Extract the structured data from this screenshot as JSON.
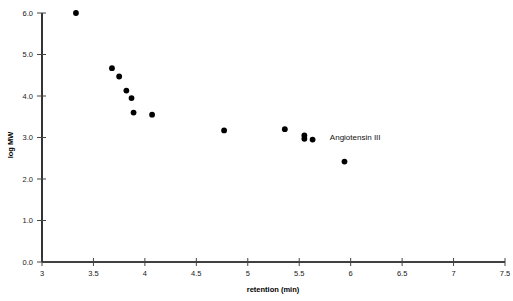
{
  "chart_data": {
    "type": "scatter",
    "title": "",
    "xlabel": "retention (min)",
    "ylabel": "log MW",
    "xlim": [
      3,
      7.5
    ],
    "ylim": [
      0.0,
      6.0
    ],
    "xticks": [
      "3",
      "3.5",
      "4",
      "4.5",
      "5",
      "5.5",
      "6",
      "6.5",
      "7",
      "7.5"
    ],
    "xtick_values": [
      3,
      3.5,
      4,
      4.5,
      5,
      5.5,
      6,
      6.5,
      7,
      7.5
    ],
    "yticks": [
      "0.0",
      "1.0",
      "2.0",
      "3.0",
      "4.0",
      "5.0",
      "6.0"
    ],
    "ytick_values": [
      0.0,
      1.0,
      2.0,
      3.0,
      4.0,
      5.0,
      6.0
    ],
    "grid": false,
    "legend": null,
    "marker": "filled-circle",
    "marker_color": "#000000",
    "x": [
      3.33,
      3.68,
      3.75,
      3.82,
      3.87,
      3.89,
      4.07,
      4.77,
      5.36,
      5.55,
      5.55,
      5.63,
      5.94
    ],
    "y": [
      6.0,
      4.67,
      4.47,
      4.13,
      3.95,
      3.6,
      3.55,
      3.17,
      3.2,
      3.05,
      2.97,
      2.95,
      2.42
    ],
    "points": [
      {
        "x": 3.33,
        "y": 6.0
      },
      {
        "x": 3.68,
        "y": 4.67
      },
      {
        "x": 3.75,
        "y": 4.47
      },
      {
        "x": 3.82,
        "y": 4.13
      },
      {
        "x": 3.87,
        "y": 3.95
      },
      {
        "x": 3.89,
        "y": 3.6
      },
      {
        "x": 4.07,
        "y": 3.55
      },
      {
        "x": 4.77,
        "y": 3.17
      },
      {
        "x": 5.36,
        "y": 3.2
      },
      {
        "x": 5.55,
        "y": 3.05
      },
      {
        "x": 5.55,
        "y": 2.97
      },
      {
        "x": 5.63,
        "y": 2.95
      },
      {
        "x": 5.94,
        "y": 2.42
      }
    ],
    "annotations": [
      {
        "text": "Angiotensin III",
        "x": 5.72,
        "y": 3.02
      }
    ]
  }
}
